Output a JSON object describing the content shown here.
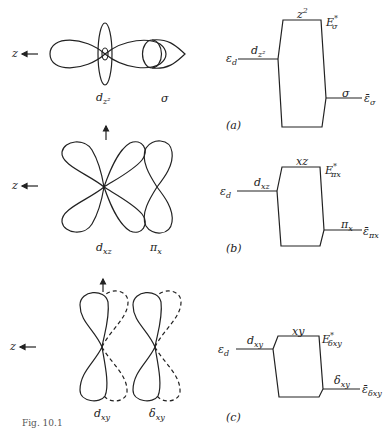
{
  "figure": {
    "caption_fragment": "Fig. 10.1",
    "axis_label": "z",
    "panels": [
      {
        "id": "a",
        "panel_label": "(a)",
        "orbitals": {
          "metal": "d",
          "metal_sub": "z²",
          "ligand": "σ"
        },
        "diagram": {
          "left_level": "ε",
          "left_level_sub": "d",
          "left_orbital": "d",
          "left_orbital_sub": "z²",
          "top_label": "z",
          "top_label_sup": "2",
          "antibonding": "E",
          "antibonding_sub": "σ",
          "antibonding_sup": "*",
          "right_orbital": "σ",
          "right_level": "ε̄",
          "right_level_sub": "σ"
        }
      },
      {
        "id": "b",
        "panel_label": "(b)",
        "orbitals": {
          "metal": "d",
          "metal_sub": "xz",
          "ligand": "π",
          "ligand_sub": "x"
        },
        "diagram": {
          "left_level": "ε",
          "left_level_sub": "d",
          "left_orbital": "d",
          "left_orbital_sub": "xz",
          "top_label": "xz",
          "antibonding": "E",
          "antibonding_sub": "πx",
          "antibonding_sup": "*",
          "right_orbital": "π",
          "right_orbital_sub": "x",
          "right_level": "ε̄",
          "right_level_sub": "πx"
        }
      },
      {
        "id": "c",
        "panel_label": "(c)",
        "orbitals": {
          "metal": "d",
          "metal_sub": "xy",
          "ligand": "δ",
          "ligand_sub": "xy"
        },
        "diagram": {
          "left_level": "ε",
          "left_level_sub": "d",
          "left_orbital": "d",
          "left_orbital_sub": "xy",
          "top_label": "xy",
          "antibonding": "E",
          "antibonding_sub": "δxy",
          "antibonding_sup": "*",
          "right_orbital": "δ",
          "right_orbital_sub": "xy",
          "right_level": "ε̄",
          "right_level_sub": "δxy"
        }
      }
    ]
  }
}
